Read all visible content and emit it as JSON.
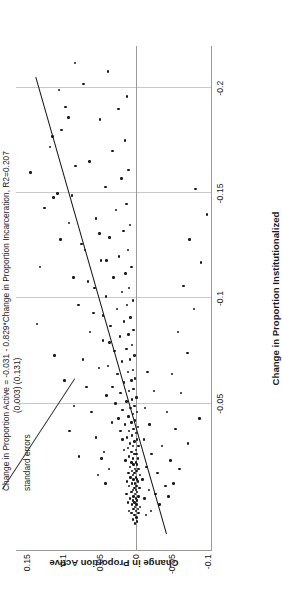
{
  "chart_data": {
    "type": "scatter",
    "title": "",
    "xlabel": "Change in Proportion Institutionalized",
    "ylabel": "Change in Proportion Active",
    "xlim": [
      0.02,
      -0.22
    ],
    "ylim": [
      -0.105,
      0.165
    ],
    "x_ticks": [
      -0.05,
      -0.1,
      -0.15,
      -0.2
    ],
    "x_tick_labels": [
      "-0.05",
      "-0.1",
      "-0.15",
      "-0.2"
    ],
    "y_ticks": [
      -0.1,
      -0.05,
      0,
      0.05,
      0.1,
      0.15
    ],
    "y_tick_labels": [
      "-0.1",
      "-0.05",
      "0",
      "0.05",
      "0.1",
      "0.15"
    ],
    "grid": "vertical-gridlines-at-x-ticks",
    "legend": "none",
    "annotation": {
      "line1": "Change in Proportion Active = -0.031 - 0.829*Change in Proportion Incarceration, R2=0.207",
      "line2": "(0.003) (0.131)",
      "line3": "standard errors",
      "intercept": -0.031,
      "slope": -0.829,
      "intercept_se": 0.003,
      "slope_se": 0.131,
      "r2": 0.207
    },
    "fit_line": {
      "x_start": 0.012,
      "y_start": -0.041,
      "x_end": -0.205,
      "y_end": 0.139,
      "color": "#111111"
    },
    "points": [
      [
        0.007,
        0.001
      ],
      [
        0.006,
        -0.002
      ],
      [
        0.005,
        0.004
      ],
      [
        0.004,
        -0.001
      ],
      [
        0.003,
        0.002
      ],
      [
        0.002,
        0.006
      ],
      [
        0.002,
        -0.004
      ],
      [
        0.001,
        0.0
      ],
      [
        0.001,
        0.009
      ],
      [
        0.0,
        -0.003
      ],
      [
        0.0,
        0.003
      ],
      [
        -0.001,
        0.001
      ],
      [
        -0.001,
        -0.006
      ],
      [
        -0.002,
        0.005
      ],
      [
        -0.002,
        -0.001
      ],
      [
        -0.003,
        0.002
      ],
      [
        -0.003,
        0.011
      ],
      [
        -0.004,
        -0.002
      ],
      [
        -0.004,
        0.004
      ],
      [
        -0.005,
        0.0
      ],
      [
        -0.005,
        0.008
      ],
      [
        -0.006,
        -0.004
      ],
      [
        -0.006,
        0.003
      ],
      [
        -0.007,
        0.001
      ],
      [
        -0.007,
        0.013
      ],
      [
        -0.008,
        -0.002
      ],
      [
        -0.008,
        0.006
      ],
      [
        -0.009,
        0.0
      ],
      [
        -0.009,
        0.004
      ],
      [
        -0.01,
        -0.005
      ],
      [
        -0.01,
        0.002
      ],
      [
        -0.011,
        0.009
      ],
      [
        -0.011,
        -0.001
      ],
      [
        -0.012,
        0.005
      ],
      [
        -0.012,
        0.001
      ],
      [
        -0.013,
        -0.003
      ],
      [
        -0.013,
        0.012
      ],
      [
        -0.014,
        0.003
      ],
      [
        -0.014,
        -0.002
      ],
      [
        -0.015,
        0.007
      ],
      [
        -0.015,
        0.0
      ],
      [
        -0.016,
        0.004
      ],
      [
        -0.016,
        -0.006
      ],
      [
        -0.017,
        0.002
      ],
      [
        -0.017,
        0.01
      ],
      [
        -0.018,
        -0.001
      ],
      [
        -0.018,
        0.005
      ],
      [
        -0.019,
        0.001
      ],
      [
        -0.019,
        -0.004
      ],
      [
        -0.02,
        0.008
      ],
      [
        -0.021,
        0.003
      ],
      [
        -0.021,
        -0.002
      ],
      [
        -0.022,
        0.006
      ],
      [
        -0.022,
        0.0
      ],
      [
        -0.023,
        0.014
      ],
      [
        -0.024,
        0.004
      ],
      [
        -0.024,
        -0.003
      ],
      [
        -0.025,
        0.009
      ],
      [
        -0.026,
        0.002
      ],
      [
        -0.026,
        -0.001
      ],
      [
        -0.027,
        0.006
      ],
      [
        -0.028,
        0.016
      ],
      [
        -0.028,
        0.0
      ],
      [
        -0.029,
        0.011
      ],
      [
        -0.03,
        0.004
      ],
      [
        -0.03,
        -0.004
      ],
      [
        -0.031,
        0.008
      ],
      [
        -0.032,
        0.002
      ],
      [
        -0.033,
        0.018
      ],
      [
        -0.033,
        -0.002
      ],
      [
        -0.034,
        0.012
      ],
      [
        -0.035,
        0.005
      ],
      [
        -0.036,
        0.0
      ],
      [
        -0.037,
        0.021
      ],
      [
        -0.037,
        0.009
      ],
      [
        -0.038,
        0.003
      ],
      [
        -0.039,
        -0.003
      ],
      [
        -0.04,
        0.015
      ],
      [
        -0.041,
        0.006
      ],
      [
        -0.042,
        0.001
      ],
      [
        -0.043,
        0.024
      ],
      [
        -0.044,
        0.01
      ],
      [
        -0.045,
        0.004
      ],
      [
        -0.046,
        -0.002
      ],
      [
        -0.047,
        0.018
      ],
      [
        -0.048,
        0.007
      ],
      [
        -0.049,
        0.002
      ],
      [
        -0.05,
        0.028
      ],
      [
        -0.051,
        0.013
      ],
      [
        -0.052,
        0.005
      ],
      [
        -0.053,
        -0.001
      ],
      [
        -0.055,
        0.021
      ],
      [
        -0.056,
        0.009
      ],
      [
        -0.057,
        0.003
      ],
      [
        -0.058,
        0.032
      ],
      [
        -0.06,
        0.016
      ],
      [
        -0.061,
        0.006
      ],
      [
        -0.062,
        0.001
      ],
      [
        -0.064,
        0.025
      ],
      [
        -0.065,
        0.011
      ],
      [
        -0.066,
        0.004
      ],
      [
        -0.068,
        0.038
      ],
      [
        -0.07,
        0.019
      ],
      [
        -0.071,
        0.008
      ],
      [
        -0.073,
        0.002
      ],
      [
        -0.075,
        0.029
      ],
      [
        -0.076,
        0.013
      ],
      [
        -0.078,
        0.005
      ],
      [
        -0.08,
        0.045
      ],
      [
        -0.082,
        0.022
      ],
      [
        -0.083,
        0.01
      ],
      [
        -0.085,
        0.003
      ],
      [
        -0.087,
        0.035
      ],
      [
        -0.089,
        0.016
      ],
      [
        -0.091,
        0.007
      ],
      [
        -0.093,
        0.058
      ],
      [
        -0.095,
        0.026
      ],
      [
        -0.097,
        0.012
      ],
      [
        -0.099,
        0.004
      ],
      [
        -0.101,
        0.041
      ],
      [
        -0.103,
        0.019
      ],
      [
        -0.105,
        0.009
      ],
      [
        -0.108,
        0.066
      ],
      [
        -0.11,
        0.031
      ],
      [
        -0.112,
        0.014
      ],
      [
        -0.115,
        0.006
      ],
      [
        -0.118,
        0.048
      ],
      [
        -0.12,
        0.023
      ],
      [
        -0.123,
        0.011
      ],
      [
        -0.126,
        0.075
      ],
      [
        -0.129,
        0.036
      ],
      [
        -0.132,
        0.017
      ],
      [
        -0.135,
        0.008
      ],
      [
        -0.138,
        0.055
      ],
      [
        -0.142,
        0.027
      ],
      [
        -0.145,
        0.013
      ],
      [
        -0.149,
        0.088
      ],
      [
        -0.153,
        0.042
      ],
      [
        -0.157,
        0.02
      ],
      [
        -0.161,
        0.01
      ],
      [
        -0.165,
        0.064
      ],
      [
        -0.17,
        0.032
      ],
      [
        -0.175,
        0.015
      ],
      [
        -0.18,
        0.102
      ],
      [
        -0.185,
        0.049
      ],
      [
        -0.19,
        0.024
      ],
      [
        -0.196,
        0.012
      ],
      [
        -0.202,
        0.072
      ],
      [
        -0.208,
        0.038
      ],
      [
        -0.034,
        0.055
      ],
      [
        -0.046,
        0.061
      ],
      [
        -0.058,
        0.068
      ],
      [
        -0.016,
        0.052
      ],
      [
        -0.024,
        0.047
      ],
      [
        -0.071,
        0.073
      ],
      [
        -0.084,
        0.063
      ],
      [
        -0.097,
        0.079
      ],
      [
        -0.11,
        0.086
      ],
      [
        -0.123,
        0.07
      ],
      [
        -0.136,
        0.092
      ],
      [
        -0.15,
        0.108
      ],
      [
        -0.163,
        0.083
      ],
      [
        -0.177,
        0.115
      ],
      [
        -0.191,
        0.097
      ],
      [
        -0.012,
        0.042
      ],
      [
        -0.019,
        0.037
      ],
      [
        -0.027,
        0.044
      ],
      [
        -0.041,
        0.033
      ],
      [
        -0.054,
        0.04
      ],
      [
        -0.067,
        0.051
      ],
      [
        -0.079,
        0.036
      ],
      [
        -0.092,
        0.045
      ],
      [
        -0.105,
        0.057
      ],
      [
        -0.118,
        0.04
      ],
      [
        -0.131,
        0.05
      ],
      [
        -0.005,
        -0.012
      ],
      [
        -0.009,
        -0.018
      ],
      [
        -0.014,
        -0.009
      ],
      [
        -0.02,
        -0.015
      ],
      [
        -0.026,
        -0.022
      ],
      [
        -0.033,
        -0.011
      ],
      [
        -0.04,
        -0.019
      ],
      [
        -0.048,
        -0.013
      ],
      [
        -0.056,
        -0.025
      ],
      [
        -0.065,
        -0.016
      ],
      [
        0.003,
        -0.014
      ],
      [
        0.001,
        -0.021
      ],
      [
        -0.002,
        -0.033
      ],
      [
        -0.007,
        -0.027
      ],
      [
        -0.011,
        -0.041
      ],
      [
        -0.017,
        -0.03
      ],
      [
        -0.023,
        -0.048
      ],
      [
        -0.03,
        -0.036
      ],
      [
        -0.038,
        -0.055
      ],
      [
        -0.046,
        -0.043
      ],
      [
        -0.055,
        -0.062
      ],
      [
        -0.064,
        -0.05
      ],
      [
        -0.074,
        -0.071
      ],
      [
        -0.084,
        -0.058
      ],
      [
        -0.095,
        -0.08
      ],
      [
        -0.106,
        -0.066
      ],
      [
        -0.117,
        -0.09
      ],
      [
        -0.128,
        -0.074
      ],
      [
        -0.14,
        -0.098
      ],
      [
        -0.152,
        -0.082
      ],
      [
        -0.031,
        -0.072
      ],
      [
        -0.043,
        -0.088
      ],
      [
        -0.019,
        -0.06
      ],
      [
        -0.012,
        -0.052
      ],
      [
        -0.006,
        -0.045
      ],
      [
        -0.088,
        0.136
      ],
      [
        -0.148,
        0.113
      ],
      [
        -0.128,
        0.104
      ],
      [
        -0.172,
        0.118
      ],
      [
        -0.186,
        0.093
      ],
      [
        -0.16,
        0.145
      ],
      [
        -0.199,
        0.106
      ],
      [
        -0.212,
        0.084
      ],
      [
        -0.143,
        0.126
      ],
      [
        -0.115,
        0.132
      ],
      [
        -0.061,
        0.098
      ],
      [
        -0.073,
        0.112
      ],
      [
        -0.049,
        0.085
      ],
      [
        -0.037,
        0.091
      ],
      [
        -0.025,
        0.078
      ]
    ]
  },
  "axis_titles": {
    "x": "Change in Proportion Institutionalized",
    "y": "Change in Proportion Active"
  }
}
